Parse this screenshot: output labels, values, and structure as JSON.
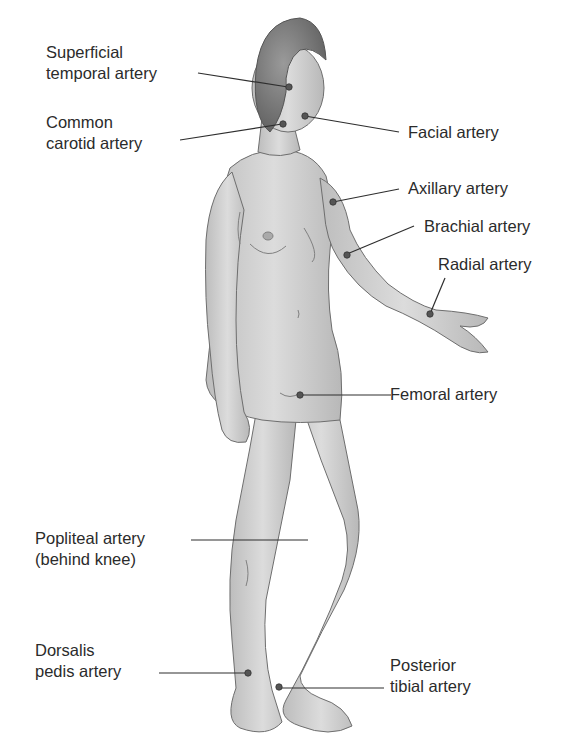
{
  "diagram": {
    "colors": {
      "skin": "#d6d6d6",
      "skin_shadow": "#a9a9a9",
      "outline": "#6e6e6e",
      "hair": "#7a7a7a",
      "leader": "#2e2e2e",
      "dot": "#555555"
    },
    "labels": [
      {
        "id": "superficial-temporal",
        "line1": "Superficial",
        "line2": "temporal artery"
      },
      {
        "id": "common-carotid",
        "line1": "Common",
        "line2": "carotid artery"
      },
      {
        "id": "facial",
        "line1": "Facial artery"
      },
      {
        "id": "axillary",
        "line1": "Axillary artery"
      },
      {
        "id": "brachial",
        "line1": "Brachial artery"
      },
      {
        "id": "radial",
        "line1": "Radial artery"
      },
      {
        "id": "femoral",
        "line1": "Femoral artery"
      },
      {
        "id": "popliteal",
        "line1": "Popliteal artery",
        "line2": "(behind knee)"
      },
      {
        "id": "dorsalis-pedis",
        "line1": "Dorsalis",
        "line2": "pedis artery"
      },
      {
        "id": "posterior-tibial",
        "line1": "Posterior",
        "line2": "tibial artery"
      }
    ]
  }
}
